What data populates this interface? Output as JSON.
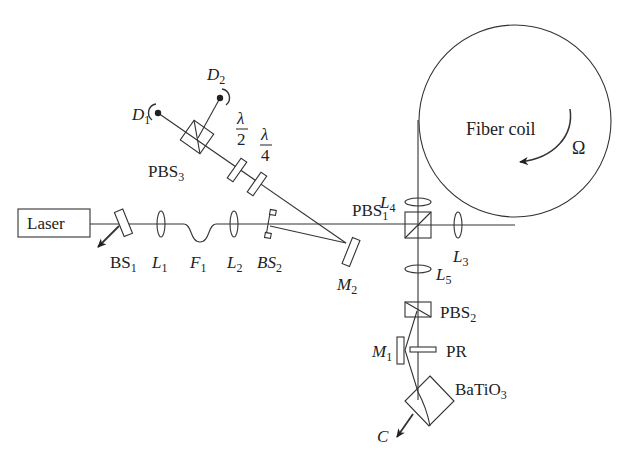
{
  "diagram": {
    "type": "optical-setup",
    "components": {
      "laser": {
        "label": "Laser"
      },
      "bs1": {
        "label": "BS",
        "sub": "1"
      },
      "l1": {
        "label": "L",
        "sub": "1"
      },
      "f1": {
        "label": "F",
        "sub": "1"
      },
      "l2": {
        "label": "L",
        "sub": "2"
      },
      "bs2": {
        "label": "BS",
        "sub": "2"
      },
      "m2": {
        "label": "M",
        "sub": "2"
      },
      "pbs1": {
        "label": "PBS",
        "sub": "1"
      },
      "pbs2": {
        "label": "PBS",
        "sub": "2"
      },
      "pbs3": {
        "label": "PBS",
        "sub": "3"
      },
      "l3": {
        "label": "L",
        "sub": "3"
      },
      "l4": {
        "label": "L",
        "sub": "4"
      },
      "l5": {
        "label": "L",
        "sub": "5"
      },
      "m1": {
        "label": "M",
        "sub": "1"
      },
      "pr": {
        "label": "PR"
      },
      "batio3": {
        "label": "BaTiO",
        "sub": "3"
      },
      "c": {
        "label": "C"
      },
      "d1": {
        "label": "D",
        "sub": "1"
      },
      "d2": {
        "label": "D",
        "sub": "2"
      },
      "half_wave": {
        "num": "λ",
        "den": "2"
      },
      "quarter_wave": {
        "num": "λ",
        "den": "4"
      },
      "fiber_coil": {
        "label": "Fiber coil"
      },
      "rotation": {
        "label": "Ω"
      }
    }
  }
}
